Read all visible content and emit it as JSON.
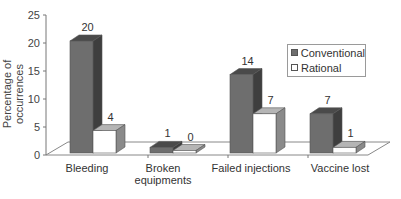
{
  "chart_data": {
    "type": "bar",
    "title": "",
    "xlabel": "",
    "ylabel": "Percentage of occurrences",
    "ylim": [
      0,
      25
    ],
    "yticks": [
      0,
      5,
      10,
      15,
      20,
      25
    ],
    "categories": [
      "Bleeding",
      "Broken equipments",
      "Failed injections",
      "Vaccine lost"
    ],
    "series": [
      {
        "name": "Conventional",
        "values": [
          20,
          1,
          14,
          7
        ],
        "color": "#6e6e6e"
      },
      {
        "name": "Rational",
        "values": [
          4,
          0,
          7,
          1
        ],
        "color": "#ffffff"
      }
    ],
    "data_labels": true,
    "legend_position": "right-inside",
    "style": "3d-clustered-bar",
    "grid": false
  },
  "legend": {
    "items": [
      {
        "label": "Conventional",
        "color": "#6e6e6e"
      },
      {
        "label": "Rational",
        "color": "#ffffff"
      }
    ]
  },
  "axis": {
    "ylabel": "Percentage of occurrences",
    "categories": [
      {
        "line1": "Bleeding",
        "line2": ""
      },
      {
        "line1": "Broken",
        "line2": "equipments"
      },
      {
        "line1": "Failed injections",
        "line2": ""
      },
      {
        "line1": "Vaccine lost",
        "line2": ""
      }
    ]
  }
}
